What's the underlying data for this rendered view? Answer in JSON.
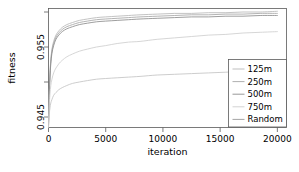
{
  "chart_data": {
    "type": "line",
    "title": "",
    "xlabel": "iteration",
    "ylabel": "fitness",
    "xlim": [
      0,
      20800
    ],
    "ylim": [
      0.9435,
      0.9605
    ],
    "grid": false,
    "legend_position": "bottom-right",
    "xticks": [
      {
        "value": 0,
        "label": "0"
      },
      {
        "value": 5000,
        "label": "5000"
      },
      {
        "value": 10000,
        "label": "10000"
      },
      {
        "value": 15000,
        "label": "15000"
      },
      {
        "value": 20000,
        "label": "20000"
      }
    ],
    "yticks_labeled": [
      {
        "value": 0.945,
        "label": "0.945"
      },
      {
        "value": 0.955,
        "label": "0.955"
      }
    ],
    "yticks_minor": [
      0.94,
      0.95,
      0.96
    ],
    "x": [
      0,
      40,
      80,
      130,
      200,
      300,
      450,
      650,
      900,
      1200,
      1600,
      2100,
      2700,
      3400,
      4200,
      5000,
      6000,
      7000,
      8000,
      9500,
      11000,
      12500,
      14000,
      15500,
      17000,
      18500,
      20000
    ],
    "series": [
      {
        "name": "125m",
        "color": "#b8b8b8",
        "values": [
          0.9438,
          0.9468,
          0.9492,
          0.9513,
          0.9532,
          0.9547,
          0.9558,
          0.9567,
          0.9573,
          0.9578,
          0.9582,
          0.9585,
          0.9588,
          0.959,
          0.9592,
          0.9593,
          0.9594,
          0.9595,
          0.9596,
          0.9597,
          0.9598,
          0.9598,
          0.9599,
          0.9599,
          0.96,
          0.96,
          0.9601
        ]
      },
      {
        "name": "250m",
        "color": "#a6a6a6",
        "values": [
          0.9438,
          0.9466,
          0.9489,
          0.951,
          0.9529,
          0.9544,
          0.9555,
          0.9564,
          0.957,
          0.9575,
          0.9579,
          0.9582,
          0.9585,
          0.9587,
          0.9589,
          0.959,
          0.9591,
          0.9592,
          0.9593,
          0.9594,
          0.9595,
          0.9596,
          0.9596,
          0.9597,
          0.9597,
          0.9598,
          0.9598
        ]
      },
      {
        "name": "500m",
        "color": "#8c8c8c",
        "values": [
          0.9437,
          0.9464,
          0.9486,
          0.9507,
          0.9526,
          0.9541,
          0.9552,
          0.9561,
          0.9567,
          0.9572,
          0.9576,
          0.9579,
          0.9582,
          0.9584,
          0.9586,
          0.9587,
          0.9588,
          0.9589,
          0.959,
          0.9591,
          0.9592,
          0.9593,
          0.9593,
          0.9594,
          0.9594,
          0.9595,
          0.9595
        ]
      },
      {
        "name": "750m",
        "color": "#cfcfcf",
        "values": [
          0.9436,
          0.9455,
          0.947,
          0.9483,
          0.9495,
          0.9504,
          0.9513,
          0.952,
          0.9526,
          0.9531,
          0.9536,
          0.954,
          0.9544,
          0.9547,
          0.955,
          0.9552,
          0.9555,
          0.9557,
          0.9558,
          0.9561,
          0.9563,
          0.9565,
          0.9567,
          0.9568,
          0.957,
          0.9571,
          0.9572
        ]
      },
      {
        "name": "Random",
        "color": "#c4c4c4",
        "values": [
          0.9435,
          0.9447,
          0.9456,
          0.9463,
          0.947,
          0.9475,
          0.9481,
          0.9485,
          0.9489,
          0.9492,
          0.9495,
          0.9498,
          0.95,
          0.9502,
          0.9504,
          0.9505,
          0.9506,
          0.9507,
          0.9508,
          0.951,
          0.9511,
          0.9512,
          0.9513,
          0.9514,
          0.9515,
          0.9516,
          0.9517
        ]
      }
    ],
    "legend_entries": [
      {
        "label": "125m",
        "color": "#b8b8b8"
      },
      {
        "label": "250m",
        "color": "#a6a6a6"
      },
      {
        "label": "500m",
        "color": "#8c8c8c"
      },
      {
        "label": "750m",
        "color": "#cfcfcf"
      },
      {
        "label": "Random",
        "color": "#9a9a9a"
      }
    ]
  }
}
